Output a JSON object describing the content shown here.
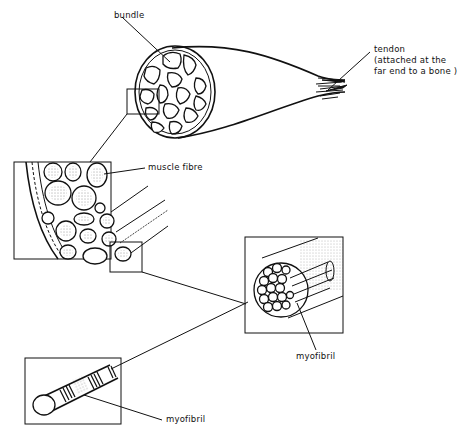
{
  "diagram": {
    "labels": {
      "bundle": "bundle",
      "tendon_line1": "tendon",
      "tendon_line2": "(attached at the",
      "tendon_line3": "far end to a bone )",
      "muscle_fibre": "muscle fibre",
      "myofibril_fibre": "myofibril",
      "myofibril_single": "myofibril"
    },
    "panels": [
      {
        "name": "whole-muscle",
        "description": "Muscle cross-section showing bundles, tapering into tendon"
      },
      {
        "name": "bundle-enlarged",
        "description": "Enlarged bundle showing muscle fibres"
      },
      {
        "name": "fibre-enlarged",
        "description": "Single muscle fibre containing myofibrils"
      },
      {
        "name": "myofibril-enlarged",
        "description": "Single striated myofibril"
      }
    ],
    "colors": {
      "ink": "#111111",
      "background": "#ffffff"
    }
  }
}
